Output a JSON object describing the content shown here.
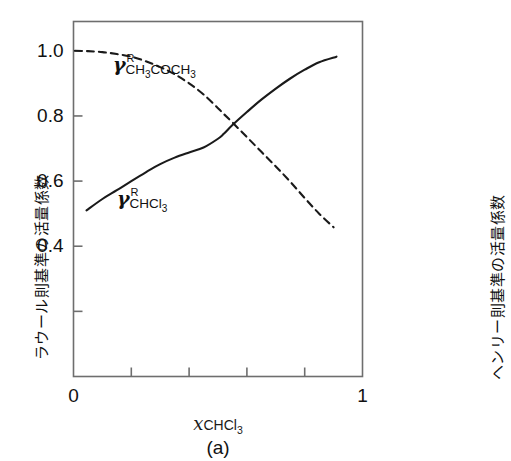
{
  "chart_data": {
    "type": "line",
    "title": "",
    "caption": "(a)",
    "xlabel_var": "x",
    "xlabel_sub": "CHCl",
    "xlabel_sub_num": "3",
    "ylabel_left": "ラウール則基準の活量係数",
    "ylabel_right": "ヘンリー則基準の活量係数",
    "xlim": [
      0,
      1
    ],
    "ylim": [
      0,
      1.09
    ],
    "grid": false,
    "legend_position": "inline-annotation",
    "xticks": [
      0,
      0.2,
      0.4,
      0.6,
      0.8,
      1
    ],
    "xtick_labels": [
      "0",
      "",
      "",
      "",
      "",
      "1"
    ],
    "yticks": [
      0.2,
      0.4,
      0.6,
      0.8,
      1.0
    ],
    "ytick_labels": [
      "",
      "0.4",
      "0.6",
      "0.8",
      "1.0"
    ],
    "series": [
      {
        "name": "gamma-R-CHCl3",
        "label_symbol": "γ",
        "label_sup": "R",
        "label_sub": "CHCl",
        "label_sub_num": "3",
        "style": "solid",
        "color": "#1a1a1a",
        "x": [
          0.045,
          0.1,
          0.15,
          0.2,
          0.25,
          0.3,
          0.35,
          0.4,
          0.45,
          0.5,
          0.52,
          0.55,
          0.6,
          0.65,
          0.7,
          0.75,
          0.8,
          0.85,
          0.91
        ],
        "y": [
          0.51,
          0.545,
          0.572,
          0.6,
          0.627,
          0.652,
          0.672,
          0.688,
          0.703,
          0.73,
          0.745,
          0.772,
          0.812,
          0.85,
          0.884,
          0.915,
          0.942,
          0.965,
          0.982
        ]
      },
      {
        "name": "gamma-R-CH3COCH3",
        "label_symbol": "γ",
        "label_sup": "R",
        "label_sub": "CH",
        "label_sub_num": "3",
        "label_sub2": "COCH",
        "label_sub2_num": "3",
        "style": "dashed",
        "color": "#1a1a1a",
        "x": [
          0.005,
          0.05,
          0.1,
          0.15,
          0.2,
          0.25,
          0.3,
          0.35,
          0.4,
          0.45,
          0.5,
          0.52,
          0.55,
          0.6,
          0.65,
          0.7,
          0.75,
          0.8,
          0.85,
          0.9
        ],
        "y": [
          1.0,
          0.999,
          0.996,
          0.99,
          0.982,
          0.968,
          0.95,
          0.928,
          0.9,
          0.866,
          0.824,
          0.806,
          0.78,
          0.735,
          0.69,
          0.645,
          0.598,
          0.548,
          0.5,
          0.458
        ]
      }
    ]
  }
}
